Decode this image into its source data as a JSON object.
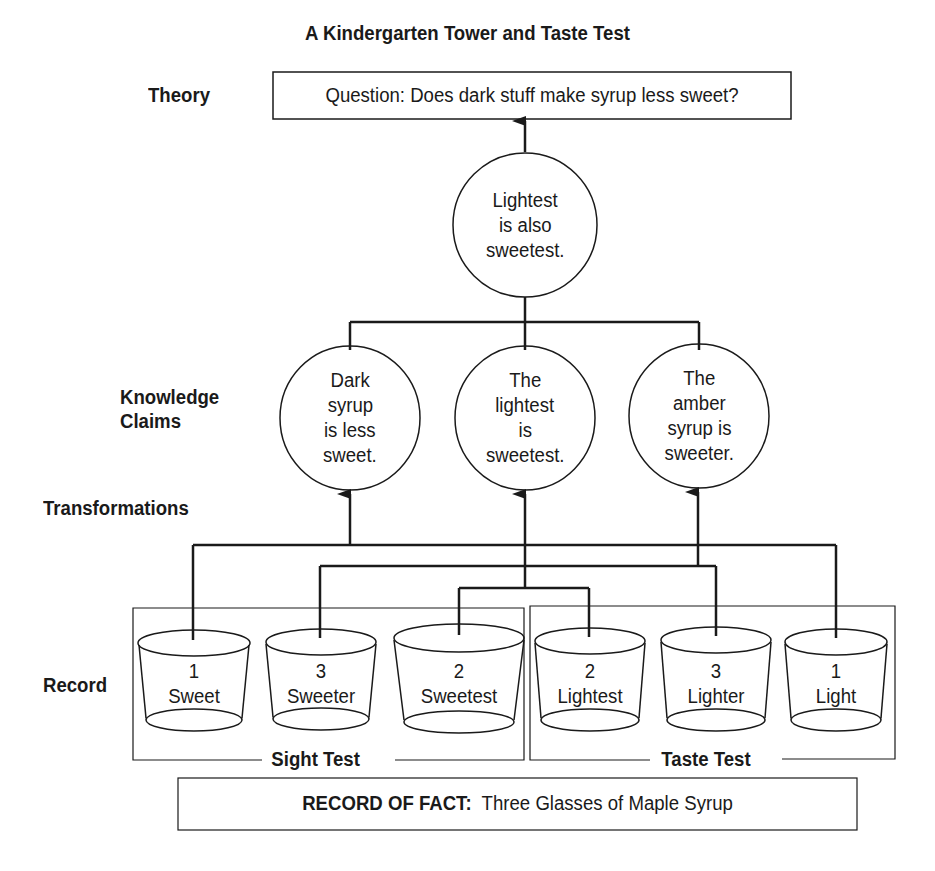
{
  "title": "A Kindergarten Tower and Taste Test",
  "row_labels": {
    "theory": "Theory",
    "knowledge_claims_line1": "Knowledge",
    "knowledge_claims_line2": "Claims",
    "transformations": "Transformations",
    "record": "Record"
  },
  "theory_box": {
    "text": "Question:  Does dark stuff make syrup less sweet?"
  },
  "summary_claim": {
    "lines": [
      "Lightest",
      "is also",
      "sweetest."
    ]
  },
  "knowledge_claims": [
    {
      "lines": [
        "Dark",
        "syrup",
        "is less",
        "sweet."
      ]
    },
    {
      "lines": [
        "The",
        "lightest",
        "is",
        "sweetest."
      ]
    },
    {
      "lines": [
        "The",
        "amber",
        "syrup is",
        "sweeter."
      ]
    }
  ],
  "sight_test": {
    "label": "Sight Test",
    "cups": [
      {
        "number": "1",
        "label": "Sweet"
      },
      {
        "number": "3",
        "label": "Sweeter"
      },
      {
        "number": "2",
        "label": "Sweetest"
      }
    ]
  },
  "taste_test": {
    "label": "Taste Test",
    "cups": [
      {
        "number": "2",
        "label": "Lightest"
      },
      {
        "number": "3",
        "label": "Lighter"
      },
      {
        "number": "1",
        "label": "Light"
      }
    ]
  },
  "record_of_fact": {
    "label": "RECORD OF FACT:",
    "text": "Three Glasses of Maple Syrup"
  },
  "colors": {
    "ink": "#1a1a1a",
    "background": "#ffffff"
  }
}
